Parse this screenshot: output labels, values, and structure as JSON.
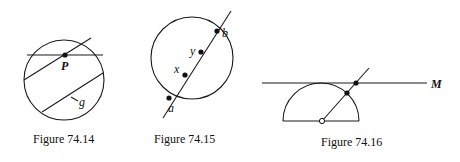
{
  "figures": [
    {
      "id": "74.14",
      "caption": "Figure 74.14",
      "labels": {
        "point": "P",
        "chord": "g"
      },
      "description": "Circle with a horizontal chord through point P and two parallel oblique chords, one labeled g"
    },
    {
      "id": "74.15",
      "caption": "Figure 74.15",
      "labels": {
        "a": "a",
        "x": "x",
        "y": "y",
        "b": "b"
      },
      "description": "Circle cut by a line; the line meets the circle at a and b, with interior points x and y between them"
    },
    {
      "id": "74.16",
      "caption": "Figure 74.16",
      "labels": {
        "line": "M"
      },
      "description": "Semicircle tangent to a horizontal line M; a ray from the open center point passes through the arc and line M (filled points)"
    }
  ]
}
